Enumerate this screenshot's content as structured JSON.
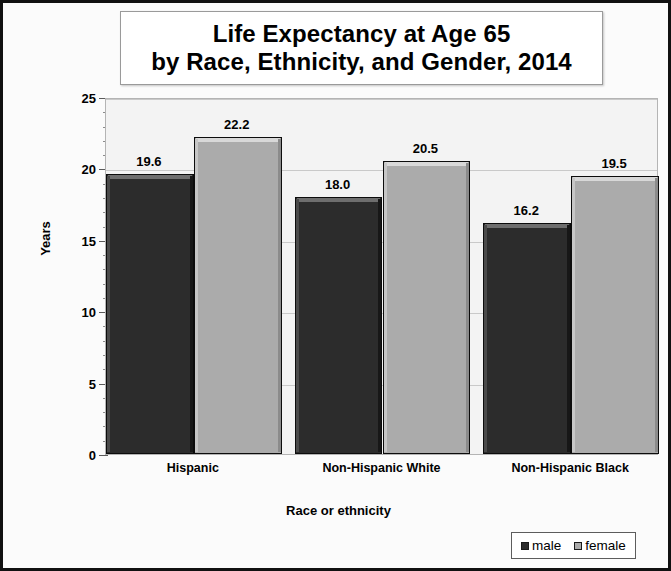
{
  "chart_data": {
    "type": "bar",
    "title": "Life Expectancy at Age 65 by Race, Ethnicity, and Gender, 2014",
    "title_line1": "Life Expectancy at Age 65",
    "title_line2": "by Race, Ethnicity, and Gender, 2014",
    "xlabel": "Race or ethnicity",
    "ylabel": "Years",
    "ylim": [
      0,
      25
    ],
    "ytick_step": 5,
    "yminor_step": 1,
    "grid": true,
    "legend_position": "bottom-right",
    "categories": [
      "Hispanic",
      "Non-Hispanic White",
      "Non-Hispanic Black"
    ],
    "series": [
      {
        "name": "male",
        "color": "#2c2c2c",
        "values": [
          19.6,
          18.0,
          16.2
        ]
      },
      {
        "name": "female",
        "color": "#ababab",
        "values": [
          22.2,
          20.5,
          19.5
        ]
      }
    ],
    "data_labels": [
      "19.6",
      "22.2",
      "18.0",
      "20.5",
      "16.2",
      "19.5"
    ],
    "ytick_labels": [
      "0",
      "5",
      "10",
      "15",
      "20",
      "25"
    ]
  },
  "legend": {
    "entries": [
      {
        "label": "male"
      },
      {
        "label": "female"
      }
    ]
  }
}
